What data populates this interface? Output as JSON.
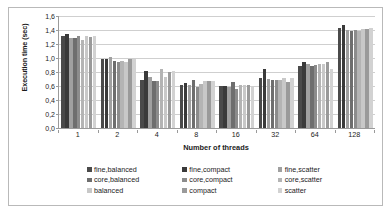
{
  "chart_data": {
    "type": "bar",
    "title": "",
    "xlabel": "Number of threads",
    "ylabel": "Execution time (sec)",
    "categories": [
      "1",
      "2",
      "4",
      "8",
      "16",
      "32",
      "64",
      "128"
    ],
    "ylim": [
      0.0,
      1.6
    ],
    "yticks": [
      "0,0",
      "0,2",
      "0,4",
      "0,6",
      "0,8",
      "1,0",
      "1,2",
      "1,4",
      "1,6"
    ],
    "ytick_values": [
      0.0,
      0.2,
      0.4,
      0.6,
      0.8,
      1.0,
      1.2,
      1.4,
      1.6
    ],
    "grid": "horizontal",
    "legend_position": "bottom",
    "decimal_separator": ",",
    "series": [
      {
        "name": "fine,balanced",
        "color": "#4a4a4a",
        "values": [
          1.31,
          0.99,
          0.69,
          0.61,
          0.6,
          0.71,
          0.88,
          1.43
        ]
      },
      {
        "name": "fine,compact",
        "color": "#3a3a3a",
        "values": [
          1.34,
          0.98,
          0.82,
          0.65,
          0.6,
          0.84,
          0.95,
          1.47
        ]
      },
      {
        "name": "fine,scatter",
        "color": "#a0a0a0",
        "values": [
          1.29,
          1.01,
          0.73,
          0.62,
          0.58,
          0.7,
          0.92,
          1.4
        ]
      },
      {
        "name": "core,balanced",
        "color": "#6e6e6e",
        "values": [
          1.28,
          0.96,
          0.67,
          0.69,
          0.66,
          0.69,
          0.88,
          1.39
        ]
      },
      {
        "name": "core,compact",
        "color": "#8c8c8c",
        "values": [
          1.31,
          0.95,
          0.67,
          0.59,
          0.56,
          0.69,
          0.9,
          1.4
        ]
      },
      {
        "name": "core,scatter",
        "color": "#b4b4b4",
        "values": [
          1.26,
          0.96,
          0.84,
          0.63,
          0.62,
          0.69,
          0.91,
          1.39
        ]
      },
      {
        "name": "balanced",
        "color": "#c8c8c8",
        "values": [
          1.31,
          0.94,
          0.73,
          0.67,
          0.61,
          0.71,
          0.92,
          1.41
        ]
      },
      {
        "name": "compact",
        "color": "#9a9a9a",
        "values": [
          1.3,
          0.98,
          0.8,
          0.67,
          0.61,
          0.66,
          0.94,
          1.42
        ]
      },
      {
        "name": "scatter",
        "color": "#d2d2d2",
        "values": [
          1.32,
          0.98,
          0.82,
          0.67,
          0.59,
          0.71,
          0.85,
          1.43
        ]
      }
    ]
  },
  "legend": {
    "items": [
      {
        "label": "fine,balanced",
        "color": "#4a4a4a"
      },
      {
        "label": "fine,compact",
        "color": "#3a3a3a"
      },
      {
        "label": "fine,scatter",
        "color": "#a0a0a0"
      },
      {
        "label": "core,balanced",
        "color": "#6e6e6e"
      },
      {
        "label": "core,compact",
        "color": "#8c8c8c"
      },
      {
        "label": "core,scatter",
        "color": "#b4b4b4"
      },
      {
        "label": "balanced",
        "color": "#c8c8c8"
      },
      {
        "label": "compact",
        "color": "#9a9a9a"
      },
      {
        "label": "scatter",
        "color": "#d2d2d2"
      }
    ]
  }
}
